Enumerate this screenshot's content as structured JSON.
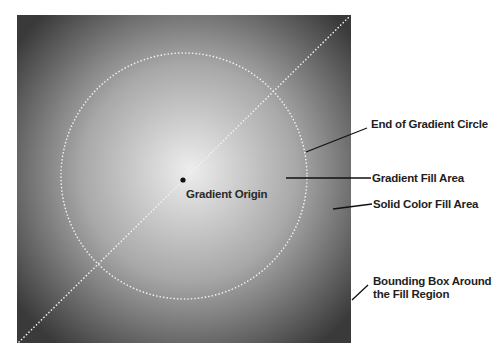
{
  "diagram": {
    "colors": {
      "gradient_center": "#ededed",
      "gradient_mid": "#a8a8a8",
      "gradient_edge": "#3a3a3a",
      "dotted_guides": "#f2f2f2",
      "leader_lines": "#111111",
      "label_text": "#1e1e1e",
      "background": "#ffffff"
    },
    "labels": {
      "origin": "Gradient Origin",
      "end_circle": "End of Gradient Circle",
      "gradient_fill": "Gradient Fill Area",
      "solid_fill": "Solid Color Fill Area",
      "bounding_box_line1": "Bounding Box Around",
      "bounding_box_line2": "the Fill Region"
    }
  }
}
